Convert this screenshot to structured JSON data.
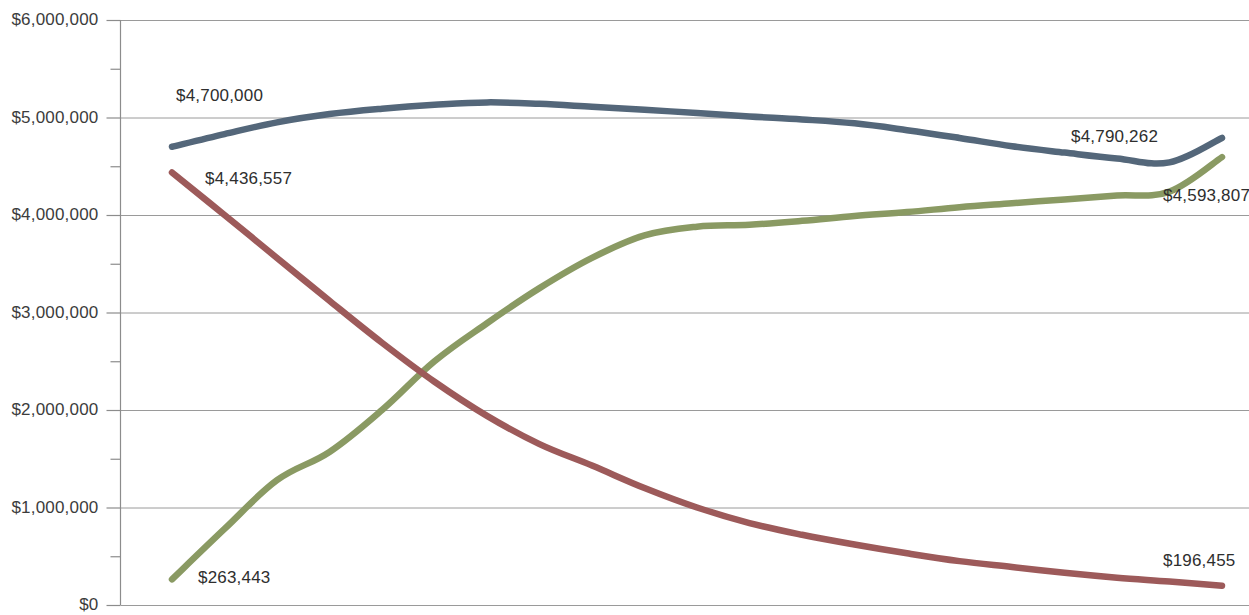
{
  "chart_data": {
    "type": "line",
    "title": "",
    "subtitle": "",
    "xlabel": "",
    "ylabel": "",
    "ylim": [
      0,
      6000000
    ],
    "xlim": [
      0,
      30
    ],
    "grid": true,
    "legend_position": "none",
    "y_ticks": [
      {
        "value": 6000000,
        "label": "$6,000,000"
      },
      {
        "value": 5000000,
        "label": "$5,000,000"
      },
      {
        "value": 4000000,
        "label": "$4,000,000"
      },
      {
        "value": 3000000,
        "label": "$3,000,000"
      },
      {
        "value": 2000000,
        "label": "$2,000,000"
      },
      {
        "value": 1000000,
        "label": "$1,000,000"
      },
      {
        "value": 0,
        "label": "$0"
      }
    ],
    "y_minor_ticks": [
      5500000,
      4500000,
      3500000,
      2500000,
      1500000,
      500000
    ],
    "x_tick_labels": [],
    "series": [
      {
        "name": "Series 1",
        "color": "#54677a",
        "start_label": "$4,700,000",
        "end_label": "$4,790,262",
        "start_value": 4700000,
        "end_value": 4790262,
        "x": [
          0,
          1,
          2,
          3,
          4,
          5,
          6,
          7,
          8,
          9,
          10,
          11,
          12,
          13,
          14,
          15,
          16,
          17,
          18,
          19,
          20
        ],
        "values": [
          4700000,
          4830000,
          4950000,
          5035000,
          5090000,
          5130000,
          5155000,
          5140000,
          5110000,
          5080000,
          5045000,
          5010000,
          4980000,
          4940000,
          4870000,
          4790000,
          4705000,
          4640000,
          4580000,
          4540000,
          4790262
        ]
      },
      {
        "name": "Series 2",
        "color": "#8a9a63",
        "start_label": "$263,443",
        "end_label": "$4,593,807",
        "start_value": 263443,
        "end_value": 4593807,
        "x": [
          0,
          1,
          2,
          3,
          4,
          5,
          6,
          7,
          8,
          9,
          10,
          11,
          12,
          13,
          14,
          15,
          16,
          17,
          18,
          19,
          20
        ],
        "values": [
          263443,
          780000,
          1280000,
          1570000,
          2000000,
          2500000,
          2890000,
          3250000,
          3560000,
          3790000,
          3880000,
          3900000,
          3940000,
          3990000,
          4030000,
          4080000,
          4120000,
          4160000,
          4200000,
          4240000,
          4593807
        ]
      },
      {
        "name": "Series 3",
        "color": "#9d5a5a",
        "start_label": "$4,436,557",
        "end_label": "$196,455",
        "start_value": 4436557,
        "end_value": 196455,
        "x": [
          0,
          1,
          2,
          3,
          4,
          5,
          6,
          7,
          8,
          9,
          10,
          11,
          12,
          13,
          14,
          15,
          16,
          17,
          18,
          19,
          20
        ],
        "values": [
          4436557,
          4000000,
          3560000,
          3120000,
          2690000,
          2290000,
          1940000,
          1650000,
          1430000,
          1200000,
          1000000,
          840000,
          720000,
          620000,
          530000,
          450000,
          390000,
          330000,
          280000,
          240000,
          196455
        ]
      }
    ],
    "annotations": [
      {
        "text": "$4,700,000",
        "series": "Series 1",
        "position": "left"
      },
      {
        "text": "$4,436,557",
        "series": "Series 3",
        "position": "left"
      },
      {
        "text": "$263,443",
        "series": "Series 2",
        "position": "left"
      },
      {
        "text": "$4,790,262",
        "series": "Series 1",
        "position": "right"
      },
      {
        "text": "$4,593,807",
        "series": "Series 2",
        "position": "right"
      },
      {
        "text": "$196,455",
        "series": "Series 3",
        "position": "right"
      }
    ],
    "colors": {
      "series_1": "#54677a",
      "series_2": "#8a9a63",
      "series_3": "#9d5a5a",
      "gridline": "#9a9a9a",
      "axis": "#8c8c8c",
      "text": "#3c3c3c",
      "background": "#ffffff"
    }
  }
}
